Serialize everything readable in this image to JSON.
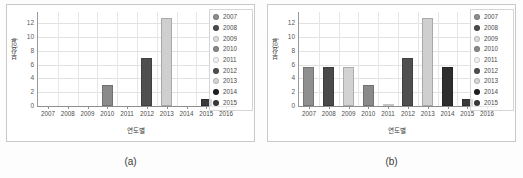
{
  "figure": {
    "background": "#fdfdfd",
    "panel_captions": [
      "(a)",
      "(b)"
    ]
  },
  "chart_data": [
    {
      "type": "bar",
      "panel": "(a)",
      "title": "",
      "xlabel": "연도별",
      "ylabel": "부상(일)",
      "categories": [
        "2007",
        "2008",
        "2009",
        "2010",
        "2011",
        "2012",
        "2013",
        "2014",
        "2015",
        "2016"
      ],
      "values": [
        0,
        0,
        0,
        3.0,
        0,
        7.0,
        12.8,
        0,
        1.0,
        0
      ],
      "bar_colors": [
        "#8f8f8f",
        "#4a4a4a",
        "#d8d8d8",
        "#8a8a8a",
        "#f2f2f2",
        "#4f4f4f",
        "#cfcfcf",
        "#2b2b2b",
        "#3a3a3a",
        "#bdbdbd"
      ],
      "ylim": [
        0,
        13.6
      ],
      "yticks": [
        0,
        2,
        4,
        6,
        8,
        10,
        12
      ],
      "grid": true,
      "legend_position": "top-right",
      "legend": [
        "2007",
        "2008",
        "2009",
        "2010",
        "2011",
        "2012",
        "2013",
        "2014",
        "2015"
      ]
    },
    {
      "type": "bar",
      "panel": "(b)",
      "title": "",
      "xlabel": "연도별",
      "ylabel": "부상(일)",
      "categories": [
        "2007",
        "2008",
        "2009",
        "2010",
        "2011",
        "2012",
        "2013",
        "2014",
        "2015",
        "2016"
      ],
      "values": [
        5.65,
        5.65,
        5.6,
        3.0,
        0.15,
        7.0,
        12.8,
        5.6,
        1.0,
        0
      ],
      "bar_colors": [
        "#8f8f8f",
        "#4a4a4a",
        "#d2d2d2",
        "#8a8a8a",
        "#f0f0f0",
        "#4f4f4f",
        "#cfcfcf",
        "#2e2e2e",
        "#3a3a3a",
        "#bdbdbd"
      ],
      "ylim": [
        0,
        13.6
      ],
      "yticks": [
        0,
        2,
        4,
        6,
        8,
        10,
        12
      ],
      "grid": true,
      "legend_position": "top-right",
      "legend": [
        "2007",
        "2008",
        "2009",
        "2010",
        "2011",
        "2012",
        "2013",
        "2014",
        "2015"
      ]
    }
  ],
  "legend_swatch_colors": [
    "#8f8f8f",
    "#4a4a4a",
    "#dcdcdc",
    "#8a8a8a",
    "#f2f2f2",
    "#4f4f4f",
    "#d6d6d6",
    "#1f1f1f",
    "#3a3a3a"
  ]
}
